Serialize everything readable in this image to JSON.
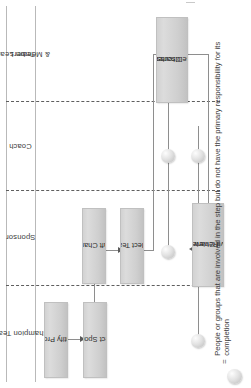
{
  "diagram": {
    "type": "swimlane-flowchart",
    "orientation": "rotated-90-ccw",
    "title": "",
    "lanes": [
      {
        "id": "team-leader-members",
        "label": "Team Leader\n& Members",
        "label_line1": "Team Leader",
        "label_line2": "& Members"
      },
      {
        "id": "coach",
        "label": "Coach",
        "label_line1": "Coach",
        "label_line2": ""
      },
      {
        "id": "sponsor",
        "label": "Sponsor",
        "label_line1": "Sponsor",
        "label_line2": ""
      },
      {
        "id": "champion-team",
        "label": "Champion Team",
        "label_line1": "Champion Team",
        "label_line2": ""
      }
    ],
    "nodes": [
      {
        "id": "identify-project",
        "label": "Identify Project",
        "line1": "Identify Project",
        "line2": "",
        "lane": "champion-team"
      },
      {
        "id": "select-sponsor",
        "label": "Select Sponsor",
        "line1": "Select Sponsor",
        "line2": "",
        "lane": "champion-team"
      },
      {
        "id": "draft-charter",
        "label": "Draft Charter",
        "line1": "Draft Charter",
        "line2": "",
        "lane": "sponsor"
      },
      {
        "id": "select-team",
        "label": "Select Team",
        "line1": "Select Team",
        "line2": "",
        "lane": "sponsor"
      },
      {
        "id": "discuss-revise-charter",
        "label": "Discuss and Revise Charter",
        "line1": "Discuss and",
        "line2": "Revise Charter",
        "lane": "team-leader-members"
      },
      {
        "id": "review-approve-charter",
        "label": "Review and Approve Charter",
        "line1": "Review and",
        "line2": "Approve Charter",
        "lane": "sponsor"
      }
    ],
    "edges": [
      {
        "from": "identify-project",
        "to": "select-sponsor"
      },
      {
        "from": "select-sponsor",
        "to": "draft-charter"
      },
      {
        "from": "draft-charter",
        "to": "select-team"
      },
      {
        "from": "select-team",
        "to": "discuss-revise-charter"
      },
      {
        "from": "discuss-revise-charter",
        "to": "review-approve-charter"
      }
    ],
    "involvement_markers": [
      {
        "id": "marker-1",
        "lane": "champion-team",
        "step": "review-approve-charter"
      },
      {
        "id": "marker-2",
        "lane": "coach",
        "step": "discuss-revise-charter"
      },
      {
        "id": "marker-3",
        "lane": "coach",
        "step": "review-approve-charter"
      },
      {
        "id": "marker-4",
        "lane": "sponsor",
        "step": "discuss-revise-charter"
      }
    ],
    "legend": {
      "symbol": "circle-marker",
      "equals": "=",
      "description": "People or groups that are involved in the step but do not have the primary responsibility for its completion"
    },
    "colors": {
      "node_fill": "#d4d4d4",
      "node_border": "#c0c0c0",
      "lane_divider": "#5e5e5e",
      "connector": "#8e8e8e",
      "text": "#3b3b3b",
      "background": "#ffffff"
    }
  }
}
